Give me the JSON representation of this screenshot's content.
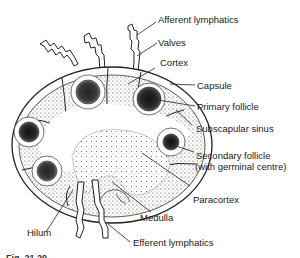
{
  "diagram": {
    "labels": {
      "afferent_lymphatics": "Afferent lymphatics",
      "valves": "Valves",
      "cortex": "Cortex",
      "capsule": "Capsule",
      "primary_follicle": "Primary follicle",
      "subscapular_sinus": "Subscapular sinus",
      "secondary_follicle_line1": "Secondary follicle",
      "secondary_follicle_line2": "(with germinal centre)",
      "paracortex": "Paracortex",
      "medulla": "Medulla",
      "hilum": "Hilum",
      "efferent_lymphatics": "Efferent lymphatics"
    },
    "caption_fragment": "Fig. 21.20"
  }
}
